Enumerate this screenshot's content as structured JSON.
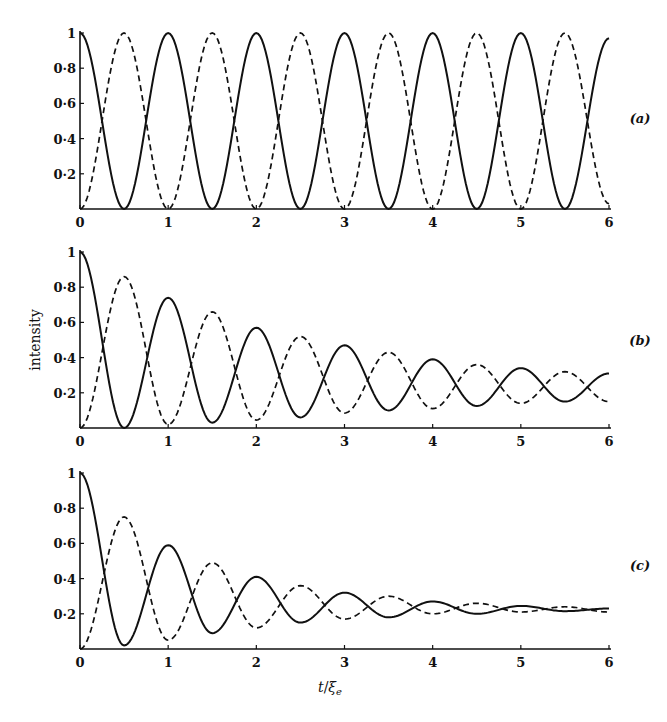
{
  "chart_data": [
    {
      "type": "line",
      "panel_label": "(a)",
      "xlabel": "",
      "ylabel": "",
      "xlim": [
        0,
        6
      ],
      "ylim": [
        0,
        1
      ],
      "x_ticks": [
        "0",
        "1",
        "2",
        "3",
        "4",
        "5",
        "6"
      ],
      "y_ticks": [
        "0·2",
        "0·4",
        "0·6",
        "0·8",
        "1"
      ],
      "grid": false,
      "extrema_t": [
        0,
        0.5,
        1,
        1.5,
        2,
        2.5,
        3,
        3.5,
        4,
        4.5,
        5,
        5.5,
        6
      ],
      "series": [
        {
          "name": "solid",
          "style": "solid",
          "values": [
            1,
            0,
            1,
            0,
            1,
            0,
            1,
            0,
            1,
            0,
            1,
            0,
            0.97
          ]
        },
        {
          "name": "dashed",
          "style": "dashed",
          "values": [
            0,
            1,
            0,
            1,
            0,
            1,
            0,
            1,
            0,
            1,
            0,
            1,
            0.03
          ]
        }
      ]
    },
    {
      "type": "line",
      "panel_label": "(b)",
      "xlabel": "",
      "ylabel": "intensity",
      "xlim": [
        0,
        6
      ],
      "ylim": [
        0,
        1
      ],
      "x_ticks": [
        "0",
        "1",
        "2",
        "3",
        "4",
        "5",
        "6"
      ],
      "y_ticks": [
        "0·2",
        "0·4",
        "0·6",
        "0·8",
        "1"
      ],
      "grid": false,
      "extrema_t": [
        0,
        0.5,
        1,
        1.5,
        2,
        2.5,
        3,
        3.5,
        4,
        4.5,
        5,
        5.5,
        6
      ],
      "series": [
        {
          "name": "solid",
          "style": "solid",
          "values": [
            1,
            0.0,
            0.74,
            0.03,
            0.57,
            0.06,
            0.47,
            0.1,
            0.39,
            0.125,
            0.34,
            0.15,
            0.31
          ]
        },
        {
          "name": "dashed",
          "style": "dashed",
          "values": [
            0,
            0.86,
            0.02,
            0.66,
            0.045,
            0.52,
            0.085,
            0.43,
            0.11,
            0.36,
            0.14,
            0.32,
            0.15
          ]
        }
      ]
    },
    {
      "type": "line",
      "panel_label": "(c)",
      "xlabel": "t/ξe",
      "ylabel": "",
      "xlim": [
        0,
        6
      ],
      "ylim": [
        0,
        1
      ],
      "x_ticks": [
        "0",
        "1",
        "2",
        "3",
        "4",
        "5",
        "6"
      ],
      "y_ticks": [
        "0·2",
        "0·4",
        "0·6",
        "0·8",
        "1"
      ],
      "grid": false,
      "extrema_t": [
        0,
        0.5,
        1,
        1.5,
        2,
        2.5,
        3,
        3.5,
        4,
        4.5,
        5,
        5.5,
        6
      ],
      "series": [
        {
          "name": "solid",
          "style": "solid",
          "values": [
            1,
            0.02,
            0.59,
            0.09,
            0.41,
            0.15,
            0.32,
            0.18,
            0.27,
            0.2,
            0.245,
            0.215,
            0.23
          ]
        },
        {
          "name": "dashed",
          "style": "dashed",
          "values": [
            0,
            0.75,
            0.05,
            0.49,
            0.12,
            0.36,
            0.17,
            0.3,
            0.2,
            0.26,
            0.21,
            0.24,
            0.21
          ]
        }
      ]
    }
  ],
  "figure": {
    "y_axis_title": "intensity",
    "x_axis_title_t": "t",
    "x_axis_title_sep": "/",
    "x_axis_title_xi": "ξ",
    "x_axis_title_sub": "e"
  }
}
